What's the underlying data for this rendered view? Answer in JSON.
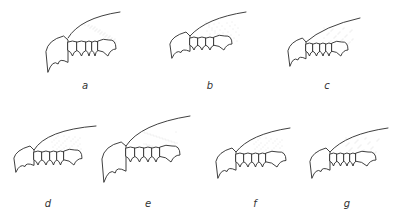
{
  "figure": {
    "panels": [
      {
        "id": "a",
        "label": "a"
      },
      {
        "id": "b",
        "label": "b"
      },
      {
        "id": "c",
        "label": "c"
      },
      {
        "id": "d",
        "label": "d"
      },
      {
        "id": "e",
        "label": "e"
      },
      {
        "id": "f",
        "label": "f"
      },
      {
        "id": "g",
        "label": "g"
      }
    ],
    "colors": {
      "line": "#2a2a2a",
      "stipple": "#c8c8c8",
      "background": "#ffffff"
    }
  }
}
